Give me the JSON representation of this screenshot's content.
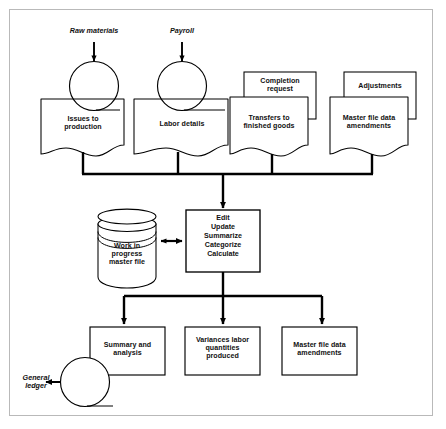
{
  "diagram": {
    "type": "flowchart",
    "border_color": "#b9b9b9",
    "line_color": "#000000",
    "background": "#ffffff",
    "external_inputs": [
      {
        "id": "raw-materials",
        "label": "Raw materials"
      },
      {
        "id": "payroll",
        "label": "Payroll"
      }
    ],
    "external_outputs": [
      {
        "id": "general-ledger",
        "label": "General\nledger"
      }
    ],
    "input_documents": [
      {
        "id": "issues-to-production",
        "label": "Issues to\nproduction",
        "stacked": false,
        "has_connector_circle": true
      },
      {
        "id": "labor-details",
        "label": "Labor details",
        "stacked": false,
        "has_connector_circle": true
      },
      {
        "id": "transfers-to-finished-goods",
        "label": "Transfers to\nfinished goods",
        "stacked": true,
        "back_label": "Completion\nrequest"
      },
      {
        "id": "master-file-data-amendments-input",
        "label": "Master file data\namendments",
        "stacked": true,
        "back_label": "Adjustments"
      }
    ],
    "process": {
      "id": "central-process",
      "label": "Edit\nUpdate\nSummarize\nCategorize\nCalculate",
      "steps": [
        "Edit",
        "Update",
        "Summarize",
        "Categorize",
        "Calculate"
      ]
    },
    "datastore": {
      "id": "work-in-progress-master-file",
      "label": "Work in\nprogress\nmaster file",
      "shape": "cylinder"
    },
    "outputs": [
      {
        "id": "summary-and-analysis",
        "label": "Summary and\nanalysis",
        "has_connector_circle": true
      },
      {
        "id": "variances-labor-quantities-produced",
        "label": "Variances labor\nquantities\nproduced",
        "has_connector_circle": false
      },
      {
        "id": "master-file-data-amendments-output",
        "label": "Master file data\namendments",
        "has_connector_circle": false
      }
    ],
    "connections": [
      {
        "from": "raw-materials",
        "to": "issues-to-production",
        "arrow": true
      },
      {
        "from": "payroll",
        "to": "labor-details",
        "arrow": true
      },
      {
        "from": "input-documents",
        "to": "central-process",
        "arrow": true,
        "style": "bus"
      },
      {
        "from": "work-in-progress-master-file",
        "to": "central-process",
        "arrow": "both"
      },
      {
        "from": "central-process",
        "to": "outputs",
        "arrow": true,
        "style": "fan"
      },
      {
        "from": "summary-and-analysis",
        "to": "general-ledger",
        "arrow": true
      }
    ]
  }
}
